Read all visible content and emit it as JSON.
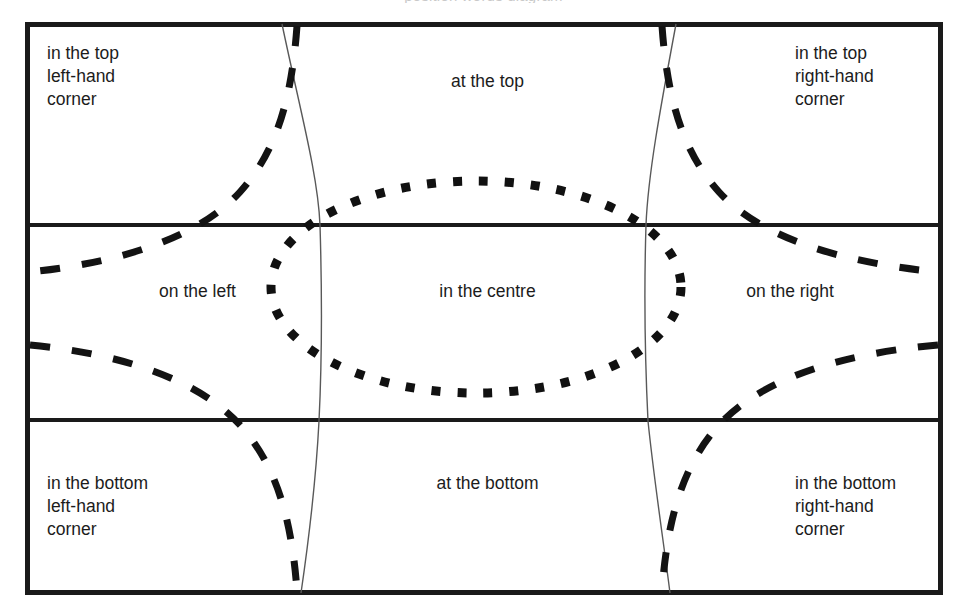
{
  "diagram": {
    "title_clipped": "position words diagram",
    "frame": {
      "border_color": "#1a1a1a",
      "divider_color": "#1a1a1a"
    },
    "cells": {
      "top_left": "in the top\nleft-hand\ncorner",
      "top_centre": "at the top",
      "top_right": "in the top\nright-hand\ncorner",
      "middle_left": "on the left",
      "middle_centre": "in the centre",
      "middle_right": "on the right",
      "bottom_left": "in the bottom\nleft-hand\ncorner",
      "bottom_centre": "at the bottom",
      "bottom_right": "in the bottom\nright-hand\ncorner"
    },
    "overlays": {
      "dotted_ellipse": {
        "style": "dotted",
        "marker": "square",
        "color": "#111111",
        "cx": 476,
        "cy": 287,
        "rx": 205,
        "ry": 106
      },
      "thin_curve_left": {
        "style": "solid-thin",
        "color": "#555555"
      },
      "thin_curve_right": {
        "style": "solid-thin",
        "color": "#555555"
      },
      "dashed_curves": {
        "style": "dashed",
        "color": "#111111",
        "count": 4
      }
    }
  }
}
